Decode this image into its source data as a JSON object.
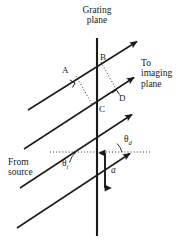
{
  "figure": {
    "type": "optics-ray-diagram",
    "width": 188,
    "height": 247,
    "background_color": "#ffffff",
    "line_color": "#1a1a1a",
    "text_color": "#1a1a1a"
  },
  "labels": {
    "grating_plane": "Grating\nplane",
    "to_imaging_plane": "To\nimaging\nplane",
    "from_source": "From\nsource",
    "point_a": "A",
    "point_b": "B",
    "point_c": "C",
    "point_d": "D",
    "angle_incident": "θ",
    "angle_incident_sub": "i",
    "angle_diffracted": "θ",
    "angle_diffracted_sub": "d",
    "spacing": "a"
  },
  "geometry": {
    "grating_line": {
      "x": 97,
      "y_top": 38,
      "y_bottom": 236
    },
    "rays": [
      {
        "name": "ray-1",
        "x1": 28,
        "y1": 110,
        "x2": 139,
        "y2": 40
      },
      {
        "name": "ray-2",
        "x1": 24,
        "y1": 149,
        "x2": 136,
        "y2": 76
      },
      {
        "name": "ray-3",
        "x1": 20,
        "y1": 188,
        "x2": 134,
        "y2": 113
      },
      {
        "name": "ray-4",
        "x1": 17,
        "y1": 228,
        "x2": 132,
        "y2": 152
      }
    ],
    "arrowheads": 4,
    "spacing_arrow": {
      "x": 105,
      "y_top": 150,
      "y_bottom": 190
    },
    "dashed_reference_line": {
      "x1": 50,
      "y": 152,
      "x2": 150
    }
  }
}
